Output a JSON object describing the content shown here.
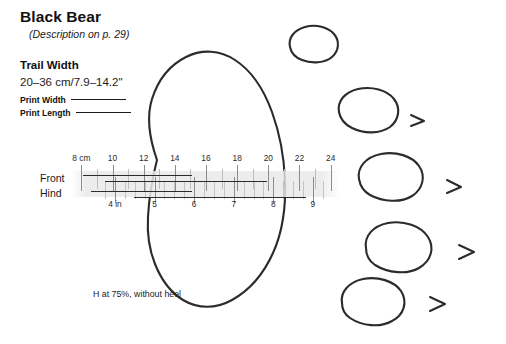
{
  "plate": {
    "title": "Black Bear",
    "subtitle": "(Description on p. 29)",
    "caption": "H at 75%, without heel",
    "ink_color": "#2b2b2b",
    "band_color": "#e9e9e9"
  },
  "measure": {
    "label": "Trail Width",
    "value": "20–36 cm/7.9–14.2\""
  },
  "legend": {
    "print_width_label": "Print Width",
    "print_length_label": "Print Length"
  },
  "ruler": {
    "front_label": "Front",
    "hind_label": "Hind",
    "cm_unit_label": "8 cm",
    "in_unit_label": "4 in",
    "cm_ticks": [
      8,
      9,
      10,
      11,
      12,
      13,
      14,
      15,
      16,
      17,
      18,
      19,
      20,
      21,
      22,
      23,
      24
    ],
    "cm_labels": [
      "8 cm",
      "10",
      "12",
      "14",
      "16",
      "18",
      "20",
      "22",
      "24"
    ],
    "cm_labeled_values": [
      8,
      10,
      12,
      14,
      16,
      18,
      20,
      22,
      24
    ],
    "cm_min": 7.4,
    "cm_max": 24.6,
    "in_ticks": [
      3.75,
      4,
      4.25,
      4.5,
      4.75,
      5,
      5.25,
      5.5,
      5.75,
      6,
      6.25,
      6.5,
      6.75,
      7,
      7.25,
      7.5,
      7.75,
      8,
      8.25,
      8.5,
      8.75,
      9,
      9.25
    ],
    "in_labels": [
      "4 in",
      "5",
      "6",
      "7",
      "8",
      "9"
    ],
    "in_labeled_values": [
      4,
      5,
      6,
      7,
      8,
      9
    ],
    "bars": [
      {
        "row": "Front",
        "kind": "Print Width",
        "from_cm": 8.1,
        "to_cm": 15.1
      },
      {
        "row": "Front",
        "kind": "Print Length",
        "from_cm": 9.5,
        "to_cm": 19.9
      },
      {
        "row": "Hind",
        "kind": "Print Width",
        "from_cm": 8.6,
        "to_cm": 15.1
      },
      {
        "row": "Hind",
        "kind": "Print Length",
        "from_cm": 11.4,
        "to_cm": 22.4
      }
    ]
  },
  "track": {
    "main_pad_name": "main-pad-outline",
    "toes": [
      {
        "name": "toe-pad-1",
        "claw": false
      },
      {
        "name": "toe-pad-2",
        "claw": true
      },
      {
        "name": "toe-pad-3",
        "claw": true
      },
      {
        "name": "toe-pad-4",
        "claw": true
      },
      {
        "name": "toe-pad-5",
        "claw": true
      }
    ]
  }
}
